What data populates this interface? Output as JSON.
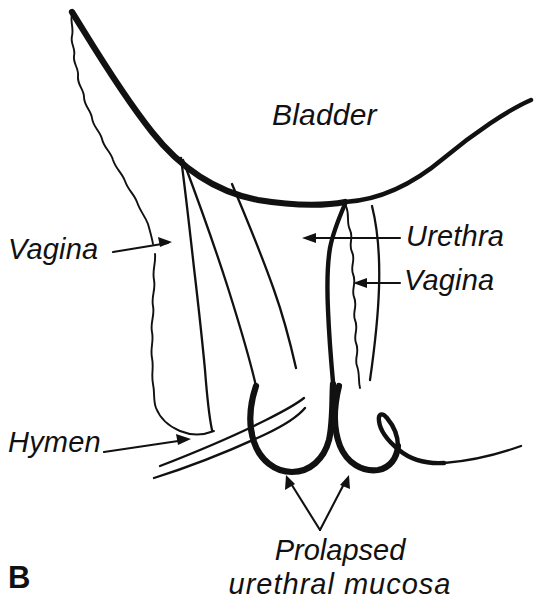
{
  "figure": {
    "panel_letter": "B",
    "background_color": "#ffffff",
    "ink_color": "#111111",
    "width": 537,
    "height": 605,
    "kind": "medical-line-drawing"
  },
  "labels": {
    "bladder": "Bladder",
    "urethra": "Urethra",
    "vagina_right": "Vagina",
    "vagina_left": "Vagina",
    "hymen": "Hymen"
  },
  "caption": {
    "line1": "Prolapsed",
    "line2": "urethral  mucosa"
  }
}
